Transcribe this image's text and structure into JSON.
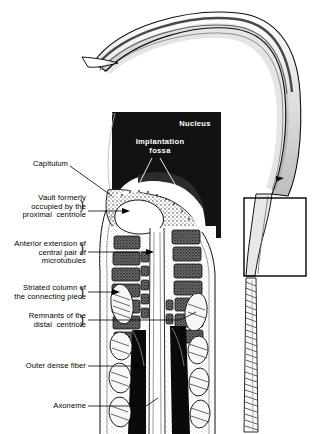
{
  "figure": {
    "colors": {
      "background": "#ffffff",
      "ink": "#000000",
      "nucleus_fill": "#121212",
      "label_text_on_dark": "#ffffff",
      "stipple_gray": "#8c8c8c",
      "mid_gray": "#b5b5b5",
      "light_gray": "#dcdcdc"
    }
  },
  "labels": {
    "nucleus": "Nucleus",
    "implantation_fossa": "Implantation\nfossa",
    "capitulum": "Capitulum",
    "vault": "Vault formerly\noccupied by the\nproximal  centriole",
    "anterior_extension": "Anterior extension of\ncentral pair of\nmicrotubules",
    "striated_column": "Striated column of\nthe connecting piece",
    "remnants": "Remnants of the\ndistal  centriole",
    "outer_dense_fiber": "Outer dense fiber",
    "axoneme": "Axoneme"
  },
  "brace_marks": {
    "vault": ")",
    "anterior_extension": ")",
    "striated_column": ")",
    "remnants": ")"
  },
  "structures": {
    "whole_sperm": "falciform sperm head with hooked apex, neck and flagellum",
    "inset_box": "rectangle highlighting the neck region enlarged at left",
    "tail": "flagellum with helical mitochondrial sheath striations"
  }
}
